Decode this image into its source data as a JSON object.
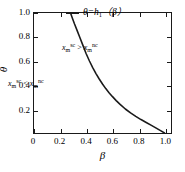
{
  "chart_data": {
    "type": "line",
    "title": "",
    "xlabel": "β",
    "ylabel": "θ",
    "xlim": [
      0,
      1.05
    ],
    "ylim": [
      0,
      1.0
    ],
    "grid": false,
    "xticks": [
      0,
      0.2,
      0.4,
      0.6,
      0.8,
      1.0
    ],
    "xticklabels": [
      "0",
      "0.2",
      "0.4",
      "0.6",
      "0.8",
      "1.0"
    ],
    "yticks": [
      0.2,
      0.4,
      0.6,
      0.8,
      1.0
    ],
    "yticklabels": [
      "0.2",
      "0.4",
      "0.6",
      "0.8",
      "1.0"
    ],
    "legend_position": "upper-right",
    "series": [
      {
        "name": "θ=h₁(β)",
        "color": "#1a1a1a",
        "linewidth": 1.6,
        "x": [
          0.28,
          0.295,
          0.31,
          0.33,
          0.35,
          0.375,
          0.4,
          0.425,
          0.45,
          0.475,
          0.5,
          0.525,
          0.55,
          0.575,
          0.6,
          0.63,
          0.66,
          0.7,
          0.74,
          0.78,
          0.82,
          0.86,
          0.9,
          0.94,
          0.97,
          1.0
        ],
        "y": [
          1.0,
          0.955,
          0.91,
          0.855,
          0.8,
          0.73,
          0.66,
          0.6,
          0.545,
          0.495,
          0.45,
          0.408,
          0.37,
          0.336,
          0.305,
          0.27,
          0.238,
          0.2,
          0.167,
          0.138,
          0.112,
          0.088,
          0.063,
          0.038,
          0.02,
          0.0
        ]
      }
    ],
    "annotations": [
      {
        "name": "region-upper",
        "base": "x",
        "subscript": "m",
        "superscript_left": "sc",
        "relation": ">",
        "superscript_right": "nc",
        "text": "x_m^sc > x_m^nc"
      },
      {
        "name": "region-lower",
        "base": "x",
        "subscript": "m",
        "superscript_left": "sc",
        "relation": "<",
        "superscript_right": "nc",
        "text": "x_m^sc < x_m^nc"
      }
    ]
  },
  "legend": {
    "label_prefix": "θ=h",
    "label_sub": "1",
    "label_suffix": "（β）"
  },
  "axis": {
    "xlabel": "β",
    "ylabel": "θ"
  },
  "annotation_parts": {
    "base": "x",
    "sub": "m",
    "sup_left": "sc",
    "sup_right": "nc",
    "gt": ">",
    "lt": "<"
  },
  "colors": {
    "curve": "#1a1a1a",
    "frame": "#1a1a1a",
    "background": "#ffffff",
    "text": "#000000"
  }
}
